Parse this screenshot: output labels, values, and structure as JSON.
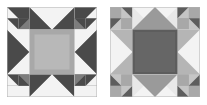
{
  "page": {
    "background": "#ffffff",
    "width": 207,
    "height": 105
  },
  "palette": {
    "white": "#f3f3f3",
    "offwhite": "#e8e8e8",
    "light": "#d9d9d9",
    "light_mid": "#cfcfcf",
    "mid": "#a8a8a8",
    "mid_gray": "#9a9a9a",
    "medium_dark": "#7d7d7d",
    "dark": "#5d5d5d",
    "very_dark": "#4a4a4a",
    "outline": "#b0b0b0",
    "border": "#c8c8c8"
  },
  "blocks": [
    {
      "name": "variable-star-sawtooth-light-center",
      "label": "Block A",
      "x": 7,
      "y": 7,
      "size": 90,
      "grid": 4,
      "center_fill": "#a8a8a8",
      "star_point_fill": "#5d5d5d",
      "corner_square_fill": "#7d7d7d",
      "background_fill": "#e8e8e8"
    },
    {
      "name": "variable-star-sawtooth-dark-center",
      "label": "Block B",
      "x": 110,
      "y": 7,
      "size": 90,
      "grid": 4,
      "center_fill": "#5d5d5d",
      "star_point_fill": "#9a9a9a",
      "corner_square_fill": "#a8a8a8",
      "background_fill": "#e8e8e8"
    }
  ]
}
